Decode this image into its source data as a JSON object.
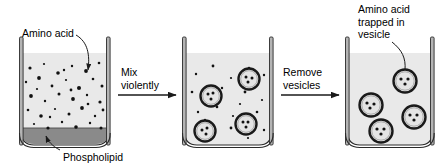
{
  "figure": {
    "background_color": "#ffffff",
    "line_color": "#1a1a1a",
    "solution_fill": "#e9e9e9",
    "phospholipid_fill": "#8a8a8a",
    "glass_fill": "#b4b4b4",
    "dot_color": "#111111"
  },
  "labels": {
    "amino_acid": "Amino acid",
    "phospholipid": "Phospholipid",
    "trapped": "Amino acid\ntrapped in\nvesicle"
  },
  "arrows": [
    {
      "name": "mix-violently",
      "label": "Mix\nviolently"
    },
    {
      "name": "remove-vesicles",
      "label": "Remove\nvesicles"
    }
  ],
  "beakers": [
    {
      "name": "beaker-1-amino-acid-solution",
      "stage": 1,
      "x": 22,
      "y": 53,
      "width": 86,
      "height": 92,
      "has_phospholipid_layer": true,
      "free_amino_acids": [
        [
          30,
          68
        ],
        [
          44,
          64
        ],
        [
          58,
          73
        ],
        [
          72,
          66
        ],
        [
          86,
          71
        ],
        [
          99,
          63
        ],
        [
          26,
          82
        ],
        [
          39,
          78
        ],
        [
          52,
          86
        ],
        [
          66,
          80
        ],
        [
          79,
          88
        ],
        [
          93,
          79
        ],
        [
          102,
          86
        ],
        [
          31,
          96
        ],
        [
          45,
          101
        ],
        [
          59,
          94
        ],
        [
          73,
          99
        ],
        [
          87,
          95
        ],
        [
          100,
          102
        ],
        [
          28,
          110
        ],
        [
          41,
          116
        ],
        [
          55,
          109
        ],
        [
          69,
          114
        ],
        [
          82,
          108
        ],
        [
          95,
          116
        ],
        [
          103,
          110
        ],
        [
          34,
          124
        ],
        [
          48,
          128
        ],
        [
          62,
          122
        ],
        [
          76,
          127
        ],
        [
          90,
          123
        ],
        [
          101,
          128
        ],
        [
          37,
          89
        ],
        [
          64,
          70
        ],
        [
          88,
          104
        ],
        [
          50,
          117
        ],
        [
          71,
          90
        ]
      ],
      "vesicles": []
    },
    {
      "name": "beaker-2-mixed-vesicles",
      "stage": 2,
      "x": 185,
      "y": 53,
      "width": 86,
      "height": 92,
      "has_phospholipid_layer": false,
      "free_amino_acids": [
        [
          196,
          74
        ],
        [
          213,
          66
        ],
        [
          231,
          78
        ],
        [
          249,
          68
        ],
        [
          264,
          75
        ],
        [
          192,
          92
        ],
        [
          209,
          99
        ],
        [
          245,
          92
        ],
        [
          262,
          100
        ],
        [
          198,
          112
        ],
        [
          217,
          107
        ],
        [
          233,
          116
        ],
        [
          257,
          112
        ],
        [
          195,
          131
        ],
        [
          212,
          136
        ],
        [
          231,
          128
        ],
        [
          248,
          138
        ],
        [
          264,
          130
        ],
        [
          222,
          88
        ],
        [
          240,
          104
        ],
        [
          205,
          120
        ]
      ],
      "vesicles": [
        {
          "cx": 211,
          "cy": 96,
          "r": 10.5,
          "inner_dots": [
            [
              -3,
              -2
            ],
            [
              2,
              -3
            ],
            [
              0,
              3
            ]
          ]
        },
        {
          "cx": 249,
          "cy": 79,
          "r": 10.5,
          "inner_dots": [
            [
              -3,
              -2
            ],
            [
              3,
              -1
            ],
            [
              -1,
              3
            ]
          ]
        },
        {
          "cx": 205,
          "cy": 131,
          "r": 10.5,
          "inner_dots": [
            [
              -3,
              -1
            ],
            [
              2,
              -3
            ],
            [
              1,
              3
            ]
          ]
        },
        {
          "cx": 246,
          "cy": 124,
          "r": 10.5,
          "inner_dots": [
            [
              -3,
              -2
            ],
            [
              2,
              -2
            ],
            [
              0,
              3
            ]
          ]
        }
      ]
    },
    {
      "name": "beaker-3-purified-vesicles",
      "stage": 3,
      "x": 348,
      "y": 53,
      "width": 84,
      "height": 92,
      "has_phospholipid_layer": false,
      "free_amino_acids": [],
      "vesicles": [
        {
          "cx": 405,
          "cy": 81,
          "r": 11.5,
          "inner_dots": [
            [
              -3,
              -2
            ],
            [
              3,
              -2
            ],
            [
              0,
              3
            ]
          ]
        },
        {
          "cx": 371,
          "cy": 105,
          "r": 11.5,
          "inner_dots": [
            [
              -3,
              -2
            ],
            [
              3,
              -1
            ],
            [
              -1,
              3
            ]
          ]
        },
        {
          "cx": 414,
          "cy": 117,
          "r": 11.5,
          "inner_dots": [
            [
              -3,
              -2
            ],
            [
              3,
              -2
            ],
            [
              0,
              3
            ]
          ]
        },
        {
          "cx": 381,
          "cy": 131,
          "r": 11.5,
          "inner_dots": [
            [
              -3,
              -2
            ],
            [
              2,
              -2
            ],
            [
              0,
              3
            ]
          ]
        }
      ]
    }
  ]
}
